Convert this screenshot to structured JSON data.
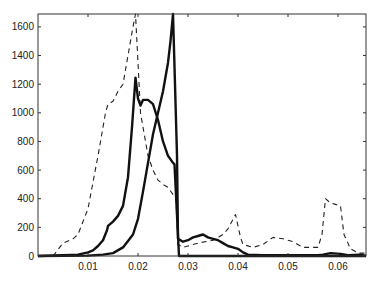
{
  "chart_data": {
    "type": "line",
    "title": "",
    "xlabel": "",
    "ylabel": "",
    "xlim": [
      0,
      0.0656
    ],
    "ylim": [
      0,
      1690
    ],
    "grid": false,
    "legend": null,
    "x_ticks": [
      0.01,
      0.02,
      0.03,
      0.04,
      0.05,
      0.06
    ],
    "x_tick_labels": [
      "0.01",
      "0.02",
      "0.03",
      "0.04",
      "0.05",
      "0.06"
    ],
    "y_ticks": [
      0,
      200,
      400,
      600,
      800,
      1000,
      1200,
      1400,
      1600
    ],
    "y_tick_labels": [
      "0",
      "200",
      "400",
      "600",
      "800",
      "1000",
      "1200",
      "1400",
      "1600"
    ],
    "series": [
      {
        "name": "dashed",
        "style": "dashed",
        "color": "#222222",
        "width": 1.1,
        "points": [
          [
            0.003,
            0
          ],
          [
            0.005,
            90
          ],
          [
            0.007,
            120
          ],
          [
            0.008,
            150
          ],
          [
            0.01,
            330
          ],
          [
            0.012,
            700
          ],
          [
            0.0135,
            1000
          ],
          [
            0.014,
            1060
          ],
          [
            0.015,
            1080
          ],
          [
            0.016,
            1150
          ],
          [
            0.017,
            1200
          ],
          [
            0.018,
            1400
          ],
          [
            0.019,
            1600
          ],
          [
            0.0195,
            1690
          ],
          [
            0.02,
            1350
          ],
          [
            0.0205,
            1000
          ],
          [
            0.021,
            900
          ],
          [
            0.022,
            700
          ],
          [
            0.023,
            600
          ],
          [
            0.024,
            530
          ],
          [
            0.025,
            500
          ],
          [
            0.026,
            480
          ],
          [
            0.0272,
            420
          ],
          [
            0.0276,
            400
          ],
          [
            0.028,
            80
          ],
          [
            0.029,
            60
          ],
          [
            0.03,
            70
          ],
          [
            0.032,
            90
          ],
          [
            0.035,
            110
          ],
          [
            0.037,
            150
          ],
          [
            0.038,
            190
          ],
          [
            0.0395,
            290
          ],
          [
            0.0405,
            130
          ],
          [
            0.041,
            80
          ],
          [
            0.043,
            60
          ],
          [
            0.045,
            80
          ],
          [
            0.047,
            130
          ],
          [
            0.049,
            120
          ],
          [
            0.051,
            100
          ],
          [
            0.053,
            60
          ],
          [
            0.056,
            60
          ],
          [
            0.0568,
            150
          ],
          [
            0.0575,
            400
          ],
          [
            0.0585,
            370
          ],
          [
            0.0595,
            360
          ],
          [
            0.0605,
            350
          ],
          [
            0.0612,
            150
          ],
          [
            0.0625,
            50
          ],
          [
            0.064,
            20
          ],
          [
            0.0655,
            20
          ]
        ]
      },
      {
        "name": "thick-a",
        "style": "solid",
        "color": "#111111",
        "width": 2.4,
        "points": [
          [
            0,
            0
          ],
          [
            0.005,
            5
          ],
          [
            0.008,
            10
          ],
          [
            0.01,
            25
          ],
          [
            0.011,
            40
          ],
          [
            0.012,
            70
          ],
          [
            0.013,
            110
          ],
          [
            0.0138,
            180
          ],
          [
            0.014,
            210
          ],
          [
            0.015,
            240
          ],
          [
            0.016,
            280
          ],
          [
            0.017,
            350
          ],
          [
            0.018,
            550
          ],
          [
            0.0188,
            900
          ],
          [
            0.0195,
            1245
          ],
          [
            0.02,
            1100
          ],
          [
            0.0205,
            1050
          ],
          [
            0.021,
            1090
          ],
          [
            0.022,
            1090
          ],
          [
            0.023,
            1060
          ],
          [
            0.024,
            950
          ],
          [
            0.025,
            800
          ],
          [
            0.026,
            700
          ],
          [
            0.027,
            650
          ],
          [
            0.0273,
            640
          ],
          [
            0.0282,
            0
          ],
          [
            0.0656,
            0
          ]
        ]
      },
      {
        "name": "thick-b",
        "style": "solid",
        "color": "#111111",
        "width": 2.4,
        "points": [
          [
            0,
            0
          ],
          [
            0.01,
            3
          ],
          [
            0.013,
            10
          ],
          [
            0.015,
            20
          ],
          [
            0.017,
            60
          ],
          [
            0.019,
            150
          ],
          [
            0.02,
            260
          ],
          [
            0.021,
            450
          ],
          [
            0.022,
            650
          ],
          [
            0.023,
            850
          ],
          [
            0.024,
            1000
          ],
          [
            0.025,
            1150
          ],
          [
            0.026,
            1350
          ],
          [
            0.0265,
            1500
          ],
          [
            0.027,
            1690
          ],
          [
            0.0274,
            1200
          ],
          [
            0.0278,
            700
          ],
          [
            0.028,
            120
          ],
          [
            0.029,
            100
          ],
          [
            0.03,
            110
          ],
          [
            0.031,
            130
          ],
          [
            0.032,
            140
          ],
          [
            0.033,
            150
          ],
          [
            0.034,
            130
          ],
          [
            0.035,
            120
          ],
          [
            0.036,
            110
          ],
          [
            0.037,
            90
          ],
          [
            0.038,
            70
          ],
          [
            0.039,
            60
          ],
          [
            0.04,
            50
          ],
          [
            0.041,
            25
          ],
          [
            0.042,
            10
          ],
          [
            0.045,
            5
          ],
          [
            0.056,
            5
          ],
          [
            0.057,
            10
          ],
          [
            0.0585,
            20
          ],
          [
            0.0605,
            15
          ],
          [
            0.062,
            5
          ],
          [
            0.0645,
            10
          ],
          [
            0.0656,
            0
          ]
        ]
      }
    ]
  },
  "plot_area": {
    "left": 38,
    "top": 14,
    "right": 366,
    "bottom": 256
  },
  "colors": {
    "axis": "#333333",
    "background": "#ffffff"
  }
}
